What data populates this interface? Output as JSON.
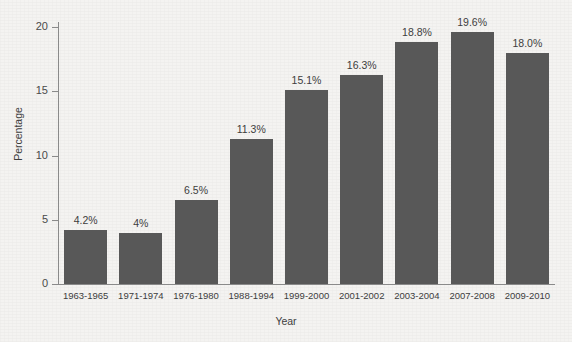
{
  "chart_data": {
    "type": "bar",
    "title": "",
    "xlabel": "Year",
    "ylabel": "Percentage",
    "categories": [
      "1963-1965",
      "1971-1974",
      "1976-1980",
      "1988-1994",
      "1999-2000",
      "2001-2002",
      "2003-2004",
      "2007-2008",
      "2009-2010"
    ],
    "values": [
      4.2,
      4.0,
      6.5,
      11.3,
      15.1,
      16.3,
      18.8,
      19.6,
      18.0
    ],
    "data_labels": [
      "4.2%",
      "4%",
      "6.5%",
      "11.3%",
      "15.1%",
      "16.3%",
      "18.8%",
      "19.6%",
      "18.0%"
    ],
    "ylim": [
      0,
      20
    ],
    "yticks": [
      0,
      5,
      10,
      15,
      20
    ],
    "ytick_labels": [
      "0",
      "5",
      "10",
      "15",
      "20"
    ],
    "grid": false,
    "legend": false,
    "bar_color": "#585858",
    "background_color": "#f4f3f1",
    "axis_color": "#8a8a8a",
    "text_color": "#3d3d3d"
  }
}
